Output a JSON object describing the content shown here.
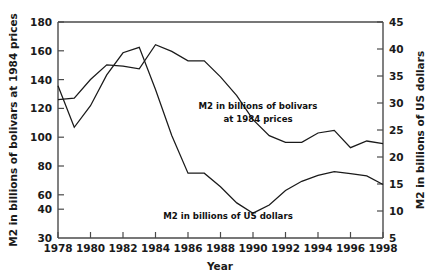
{
  "chart_data": {
    "type": "line",
    "title": "",
    "xlabel": "Year",
    "ylabel_left": "M2 in billions of bolivars at 1984 prices",
    "ylabel_right": "M2 in billions of US dollars",
    "xlim": [
      1978,
      1998
    ],
    "ylim_left": [
      30,
      180
    ],
    "ylim_right": [
      5,
      45
    ],
    "grid": false,
    "legend": "none",
    "x_ticks": [
      1978,
      1980,
      1982,
      1984,
      1986,
      1988,
      1990,
      1992,
      1994,
      1996,
      1998
    ],
    "x_tick_labels": [
      "1978",
      "1980",
      "1982",
      "1984",
      "1986",
      "1988",
      "1990",
      "1992",
      "1994",
      "1996",
      "1998"
    ],
    "y_ticks_left": [
      30,
      40,
      60,
      80,
      100,
      120,
      140,
      160,
      180
    ],
    "y_tick_labels_left": [
      "30",
      "40",
      "60",
      "80",
      "100",
      "120",
      "140",
      "160",
      "180"
    ],
    "y_ticks_right": [
      5,
      10,
      15,
      20,
      25,
      30,
      35,
      40,
      45
    ],
    "y_tick_labels_right": [
      "5",
      "10",
      "15",
      "20",
      "25",
      "30",
      "35",
      "40",
      "45"
    ],
    "x": [
      1978,
      1979,
      1980,
      1981,
      1982,
      1983,
      1984,
      1985,
      1986,
      1987,
      1988,
      1989,
      1990,
      1991,
      1992,
      1993,
      1994,
      1995,
      1996,
      1997,
      1998
    ],
    "series": [
      {
        "name": "M2 in billions of bolivars at 1984 prices",
        "axis": "left",
        "units": "billions of bolivars at 1984 prices",
        "values": [
          122,
          123,
          137,
          148,
          147,
          145,
          163,
          158,
          151,
          151,
          139,
          125,
          107,
          95,
          90,
          90,
          97,
          99,
          86,
          91,
          89
        ]
      },
      {
        "name": "M2 in billions of US dollars",
        "axis": "right",
        "units": "billions of US dollars",
        "values": [
          33.2,
          25.5,
          29.5,
          35.2,
          39.3,
          40.3,
          32.5,
          24.0,
          17.0,
          17.0,
          14.5,
          11.5,
          9.6,
          11.1,
          13.8,
          15.5,
          16.6,
          17.3,
          16.9,
          16.5,
          14.9
        ]
      }
    ],
    "annotations": [
      {
        "name": "bolivars-annotation",
        "lines": [
          "M2 in billions of bolivars",
          "at 1984 prices"
        ],
        "x_px": 258,
        "y_px": 106
      },
      {
        "name": "dollars-annotation",
        "lines": [
          "M2 in billions of US dollars"
        ],
        "x_px": 230,
        "y_px": 216
      }
    ]
  },
  "axes": {
    "x_title": "Year",
    "y_left_title": "M2 in billions of bolivars at 1984 prices",
    "y_right_title": "M2 in billions of US dollars"
  },
  "annotation_bolivars_line1": "M2 in billions of bolivars",
  "annotation_bolivars_line2": "at 1984 prices",
  "annotation_dollars_line1": "M2 in billions of US dollars",
  "colors": {
    "line": "#1a1a1a",
    "axis": "#4a4a4a",
    "background": "#ffffff",
    "text": "#1a1a1a"
  }
}
